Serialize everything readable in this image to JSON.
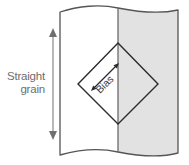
{
  "figure": {
    "name": "fabric-grain-bias-diagram",
    "background_color": "#ffffff"
  },
  "fabric": {
    "name": "fabric-piece",
    "outline_color": "#555555",
    "left_half_fill": "#ffffff",
    "right_half_fill": "#e2e2e2",
    "fold_line_color": "#6a6a6a",
    "edge_style": "wavy"
  },
  "straight_grain": {
    "label_line_1": "Straight",
    "label_line_2": "grain",
    "arrow_color": "#9a9a9a",
    "arrow_direction": "double-vertical"
  },
  "bias": {
    "label": "Bias",
    "arrow_color": "#2b2b2b",
    "arrow_direction": "double-diagonal",
    "text_rotation_degrees": -45
  },
  "diamond": {
    "name": "bias-square",
    "outline_color": "#2b2b2b",
    "rotation_degrees": 45
  }
}
